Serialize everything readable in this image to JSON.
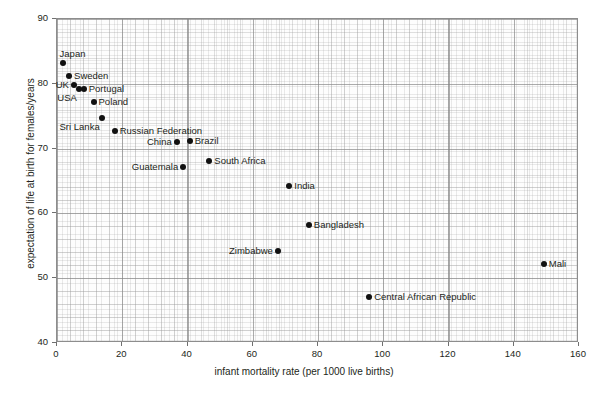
{
  "chart_data": {
    "type": "scatter",
    "title": "",
    "xlabel": "infant mortality rate (per 1000 live births)",
    "ylabel": "expectation of life at birth for females/years",
    "xlim": [
      0,
      160
    ],
    "ylim": [
      40,
      90
    ],
    "xticks": [
      0,
      20,
      40,
      60,
      80,
      100,
      120,
      140,
      160
    ],
    "yticks": [
      40,
      50,
      60,
      70,
      80,
      90
    ],
    "xtick_labels": [
      "0",
      "20",
      "40",
      "60",
      "80",
      "100",
      "120",
      "140",
      "160"
    ],
    "ytick_labels": [
      "40",
      "50",
      "60",
      "70",
      "80",
      "90"
    ],
    "grid": true,
    "grid_style": "graph-paper minor and major gridlines",
    "legend": "none",
    "marker": "filled-circle",
    "marker_color": "#111111",
    "points": [
      {
        "label": "Japan",
        "x": 2,
        "y": 83,
        "label_side": "above"
      },
      {
        "label": "Sweden",
        "x": 4,
        "y": 81,
        "label_side": "right"
      },
      {
        "label": "UK",
        "x": 5.5,
        "y": 79.6,
        "label_side": "left"
      },
      {
        "label": "USA",
        "x": 7,
        "y": 79,
        "label_side": "below-left"
      },
      {
        "label": "Portugal",
        "x": 8.5,
        "y": 79,
        "label_side": "right"
      },
      {
        "label": "Poland",
        "x": 11.5,
        "y": 77,
        "label_side": "right"
      },
      {
        "label": "Sri Lanka",
        "x": 14,
        "y": 74.5,
        "label_side": "below-left"
      },
      {
        "label": "Russian Federation",
        "x": 18,
        "y": 72.5,
        "label_side": "right"
      },
      {
        "label": "China",
        "x": 37,
        "y": 70.8,
        "label_side": "left"
      },
      {
        "label": "Brazil",
        "x": 41,
        "y": 71,
        "label_side": "right"
      },
      {
        "label": "Guatemala",
        "x": 39,
        "y": 67,
        "label_side": "left"
      },
      {
        "label": "South Africa",
        "x": 47,
        "y": 68,
        "label_side": "right"
      },
      {
        "label": "India",
        "x": 71.5,
        "y": 64,
        "label_side": "right"
      },
      {
        "label": "Zimbabwe",
        "x": 68,
        "y": 54,
        "label_side": "left"
      },
      {
        "label": "Bangladesh",
        "x": 77.5,
        "y": 58,
        "label_side": "right"
      },
      {
        "label": "Central African Republic",
        "x": 96,
        "y": 47,
        "label_side": "right"
      },
      {
        "label": "Mali",
        "x": 149.5,
        "y": 52,
        "label_side": "right"
      }
    ]
  }
}
